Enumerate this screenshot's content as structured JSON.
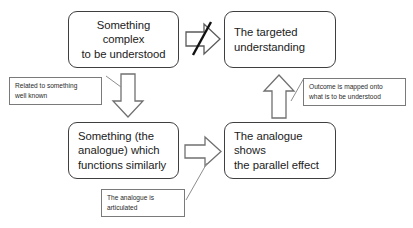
{
  "diagram": {
    "background_color": "#ffffff",
    "box_border_color": "#3f3f3f",
    "callout_border_color": "#7a7a7a",
    "arrow_stroke_color": "#707070",
    "negation_slash_color": "#111111",
    "nodes": [
      {
        "id": "source-problem",
        "label": "Something complex\nto be understood",
        "align": "center"
      },
      {
        "id": "target-understanding",
        "label": "The targeted\nunderstanding",
        "align": "left"
      },
      {
        "id": "analogue",
        "label": "Something (the\nanalogue) which\nfunctions similarly",
        "align": "left"
      },
      {
        "id": "parallel-effect",
        "label": "The analogue shows\nthe parallel effect",
        "align": "left"
      }
    ],
    "callouts": [
      {
        "id": "related-note",
        "label": "Related to something\nwell known"
      },
      {
        "id": "outcome-note",
        "label": "Outcome is mapped onto\nwhat is to be understood"
      },
      {
        "id": "articulated-note",
        "label": "The analogue is\narticulated"
      }
    ],
    "arrows": [
      {
        "id": "blocked-direct-arrow",
        "direction": "right",
        "negated": true
      },
      {
        "id": "down-arrow",
        "direction": "down",
        "negated": false
      },
      {
        "id": "right-arrow",
        "direction": "right",
        "negated": false
      },
      {
        "id": "up-arrow",
        "direction": "up",
        "negated": false
      }
    ]
  }
}
